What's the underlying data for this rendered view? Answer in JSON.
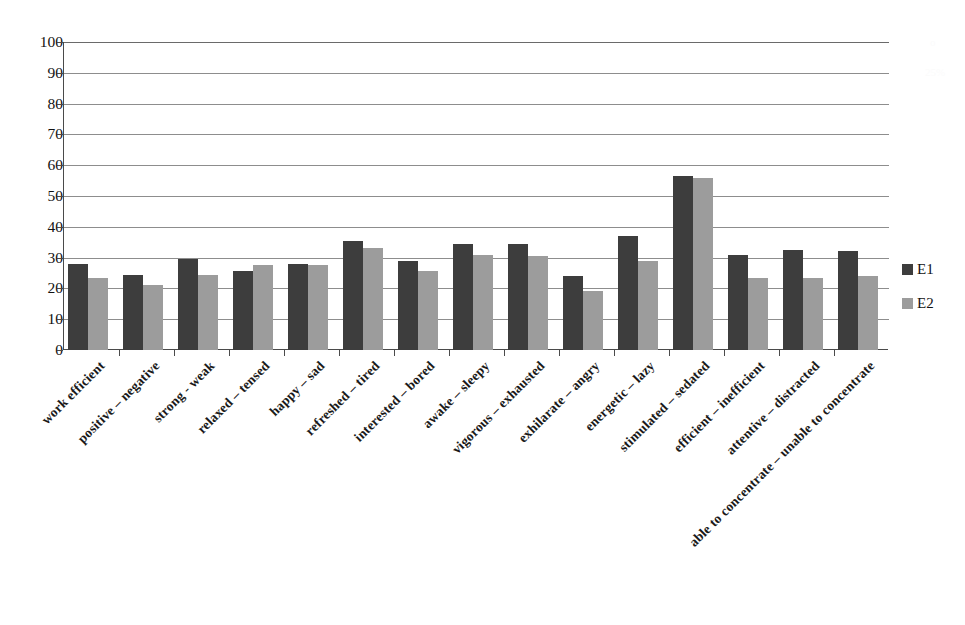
{
  "chart_data": {
    "type": "bar",
    "title": "",
    "subtitle": "",
    "xlabel": "",
    "ylabel": "",
    "ylim": [
      0,
      100
    ],
    "ytick_step": 10,
    "yticks": [
      100,
      90,
      80,
      70,
      60,
      50,
      40,
      30,
      20,
      10,
      0
    ],
    "grid": true,
    "grid_axis": "y",
    "legend_position": "right",
    "categories": [
      "work efficient",
      "positive – negative",
      "strong - weak",
      "relaxed – tensed",
      "happy – sad",
      "refreshed – tired",
      "interested – bored",
      "awake – sleepy",
      "vigorous – exhausted",
      "exhilarate – angry",
      "energetic – lazy",
      "stimulated – sedated",
      "efficient – inefficient",
      "attentive – distracted",
      "able to concentrate – unable to concentrate"
    ],
    "series": [
      {
        "name": "E1",
        "color": "#3d3d3d",
        "values": [
          28,
          24.5,
          29.5,
          25.5,
          28,
          35.5,
          29,
          34.5,
          34.5,
          24,
          37,
          56.5,
          31,
          32.5,
          32
        ]
      },
      {
        "name": "E2",
        "color": "#9c9c9c",
        "values": [
          23.5,
          21,
          24.5,
          27.5,
          27.5,
          33,
          25.5,
          31,
          30.5,
          19,
          29,
          56,
          23.5,
          23.5,
          24
        ]
      }
    ]
  },
  "legend": {
    "entries": [
      {
        "label": "E1",
        "color": "#3d3d3d"
      },
      {
        "label": "E2",
        "color": "#9c9c9c"
      }
    ]
  }
}
